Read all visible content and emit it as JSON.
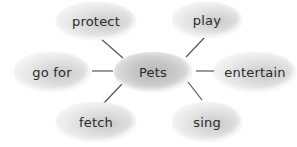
{
  "diagram": {
    "type": "word-web",
    "center": {
      "label": "Pets"
    },
    "nodes": [
      {
        "id": "protect",
        "label": "protect",
        "position": "top-left"
      },
      {
        "id": "play",
        "label": "play",
        "position": "top-right"
      },
      {
        "id": "go-for",
        "label": "go for",
        "position": "left"
      },
      {
        "id": "entertain",
        "label": "entertain",
        "position": "right"
      },
      {
        "id": "fetch",
        "label": "fetch",
        "position": "bottom-left"
      },
      {
        "id": "sing",
        "label": "sing",
        "position": "bottom-right"
      }
    ],
    "edges": [
      {
        "from": "Pets",
        "to": "protect"
      },
      {
        "from": "Pets",
        "to": "play"
      },
      {
        "from": "Pets",
        "to": "go for"
      },
      {
        "from": "Pets",
        "to": "entertain"
      },
      {
        "from": "Pets",
        "to": "fetch"
      },
      {
        "from": "Pets",
        "to": "sing"
      }
    ],
    "colors": {
      "line": "#555555",
      "text": "#2a2a2a",
      "bubble": "#d4d4d4"
    }
  }
}
